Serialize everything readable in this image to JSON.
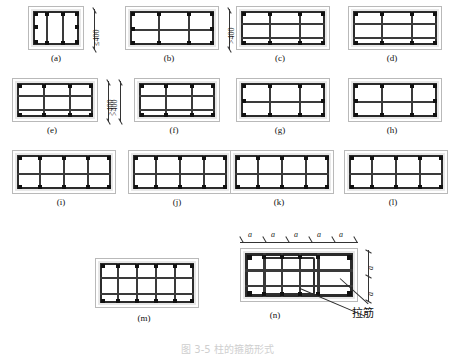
{
  "figure": {
    "bottom_caption": "图 3-5 柱的箍筋形式"
  },
  "annotations": {
    "le400": "≤400",
    "gt400": ">400",
    "spacing": "a",
    "tie_bar": "拉筋"
  },
  "colors": {
    "concrete": "#e8e8e8",
    "steel": "#2b2b2b",
    "bar": "#111111",
    "outline": "#b9b9b9"
  },
  "panels": [
    {
      "id": "a",
      "caption": "(a)",
      "cols": 3,
      "rows": 1,
      "dim_right": "≤400"
    },
    {
      "id": "b",
      "caption": "(b)",
      "cols": 3,
      "rows": 2,
      "dim_right": ">400"
    },
    {
      "id": "c",
      "caption": "(c)",
      "cols": 3,
      "rows": 3,
      "dim_right": ""
    },
    {
      "id": "d",
      "caption": "(d)",
      "cols": 3,
      "rows": 3,
      "dim_right": ""
    },
    {
      "id": "e",
      "caption": "(e)",
      "cols": 3,
      "rows": 3,
      "dim_right": ">400"
    },
    {
      "id": "f",
      "caption": "(f)",
      "cols": 3,
      "rows": 3,
      "dim_left": ">400"
    },
    {
      "id": "g",
      "caption": "(g)",
      "cols": 3,
      "rows": 2,
      "dim_right": ""
    },
    {
      "id": "h",
      "caption": "(h)",
      "cols": 3,
      "rows": 2,
      "dim_right": ""
    },
    {
      "id": "i",
      "caption": "(i)",
      "cols": 4,
      "rows": 2,
      "dim_right": ""
    },
    {
      "id": "j",
      "caption": "(j)",
      "cols": 4,
      "rows": 2,
      "dim_right": ""
    },
    {
      "id": "k",
      "caption": "(k)",
      "cols": 4,
      "rows": 2,
      "dim_right": ""
    },
    {
      "id": "l",
      "caption": "(l)",
      "cols": 4,
      "rows": 2,
      "dim_right": ""
    },
    {
      "id": "m",
      "caption": "(m)",
      "cols": 5,
      "rows": 3,
      "dim_right": ""
    },
    {
      "id": "n",
      "caption": "(n)",
      "cols": 5,
      "rows": 3,
      "dim_right": ""
    }
  ],
  "panel_n": {
    "caption": "(n)",
    "top_spacings": [
      "a",
      "a",
      "a",
      "a",
      "a"
    ],
    "right_spacings": [
      "a",
      "a"
    ],
    "tie_label": "拉筋"
  }
}
